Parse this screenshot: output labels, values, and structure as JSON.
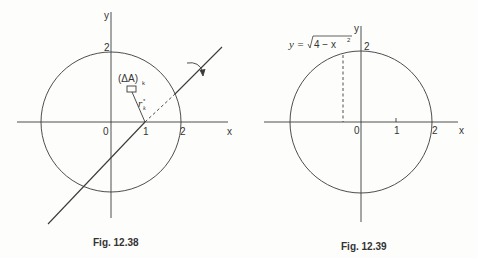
{
  "figures": [
    {
      "id": "left",
      "caption": "Fig. 12.38",
      "axis_x_label": "x",
      "axis_y_label": "y",
      "tick_labels": {
        "origin": "0",
        "x1": "1",
        "x2": "2",
        "y2": "2"
      },
      "region_label": "(ΔA)",
      "region_subscript": "k",
      "radius_label": "r",
      "radius_sub": "k",
      "radius_sup": "*",
      "description": "Circle of radius 2 centered at origin, with an axis of rotation line through (1,0) at slope 1; rotation arrow near upper right; small area element (ΔA)_k with distance r_k* to the axis"
    },
    {
      "id": "right",
      "caption": "Fig. 12.39",
      "axis_x_label": "x",
      "axis_y_label": "y",
      "tick_labels": {
        "origin": "0",
        "x1": "1",
        "x2": "2",
        "y2": "2"
      },
      "curve_label_lhs": "y = ",
      "curve_label_sqrt": "4 − x",
      "curve_label_exp": "2",
      "description": "Circle of radius 2 centered at origin with a dashed vertical segment from the x-axis to the upper semicircle"
    }
  ],
  "colors": {
    "line": "#3a3a3a",
    "background": "#fdfdfb"
  }
}
